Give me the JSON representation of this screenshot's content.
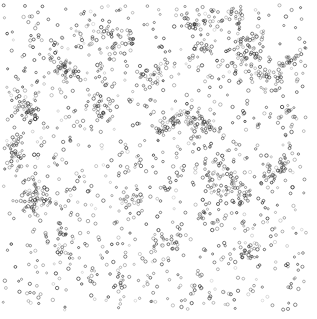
{
  "figure": {
    "width": 317,
    "height": 319,
    "background_color": "#ffffff",
    "has_axes": false,
    "has_border": false,
    "has_title": false,
    "has_legend": false,
    "has_gridlines": false,
    "has_tick_labels": false
  },
  "chart_data": {
    "type": "scatter",
    "title": "",
    "subtitle": "",
    "xlabel": "",
    "ylabel": "",
    "xlim": [
      0,
      317
    ],
    "ylim": [
      0,
      319
    ],
    "grid": false,
    "legend": null,
    "annotations": [],
    "tick_labels_x": [],
    "tick_labels_y": [],
    "marker": {
      "shape": "circle-open",
      "radius_px": 1.35,
      "line_width_px": 0.8,
      "fill": "none",
      "edge_color": "#3a3a3a",
      "edge_color_light": "#9a9a9a",
      "edge_color_dark": "#1a1a1a",
      "opacity_range": [
        0.35,
        0.95
      ]
    },
    "point_count_approx": 1760,
    "distribution": {
      "model": "clustered-plus-uniform-noise",
      "cluster_count": 46,
      "cluster_point_fraction": 0.55,
      "noise_point_fraction": 0.45,
      "cluster_sigma_px_range": [
        3.5,
        9.0
      ],
      "cluster_size_range": [
        9,
        34
      ],
      "plot_margin_px": {
        "top": 5,
        "right": 11,
        "bottom": 9,
        "left": 3
      }
    },
    "clusters": [
      {
        "x": 208,
        "y": 16,
        "n": 26,
        "s": 8.5
      },
      {
        "x": 236,
        "y": 14,
        "n": 18,
        "s": 6.0
      },
      {
        "x": 196,
        "y": 24,
        "n": 14,
        "s": 5.0
      },
      {
        "x": 78,
        "y": 37,
        "n": 22,
        "s": 9.0
      },
      {
        "x": 113,
        "y": 36,
        "n": 16,
        "s": 6.5
      },
      {
        "x": 126,
        "y": 40,
        "n": 12,
        "s": 5.0
      },
      {
        "x": 200,
        "y": 48,
        "n": 20,
        "s": 7.0
      },
      {
        "x": 246,
        "y": 47,
        "n": 15,
        "s": 6.0
      },
      {
        "x": 256,
        "y": 40,
        "n": 13,
        "s": 5.5
      },
      {
        "x": 241,
        "y": 62,
        "n": 24,
        "s": 7.5
      },
      {
        "x": 262,
        "y": 74,
        "n": 28,
        "s": 8.0
      },
      {
        "x": 274,
        "y": 70,
        "n": 16,
        "s": 6.0
      },
      {
        "x": 289,
        "y": 59,
        "n": 14,
        "s": 6.0
      },
      {
        "x": 57,
        "y": 64,
        "n": 18,
        "s": 7.0
      },
      {
        "x": 63,
        "y": 70,
        "n": 14,
        "s": 5.5
      },
      {
        "x": 74,
        "y": 71,
        "n": 12,
        "s": 5.0
      },
      {
        "x": 103,
        "y": 70,
        "n": 16,
        "s": 6.5
      },
      {
        "x": 152,
        "y": 72,
        "n": 14,
        "s": 6.0
      },
      {
        "x": 148,
        "y": 80,
        "n": 11,
        "s": 5.0
      },
      {
        "x": 22,
        "y": 101,
        "n": 24,
        "s": 8.0
      },
      {
        "x": 30,
        "y": 110,
        "n": 20,
        "s": 6.5
      },
      {
        "x": 98,
        "y": 104,
        "n": 18,
        "s": 6.5
      },
      {
        "x": 103,
        "y": 112,
        "n": 13,
        "s": 5.0
      },
      {
        "x": 176,
        "y": 120,
        "n": 22,
        "s": 7.5
      },
      {
        "x": 190,
        "y": 116,
        "n": 17,
        "s": 6.0
      },
      {
        "x": 197,
        "y": 132,
        "n": 20,
        "s": 7.0
      },
      {
        "x": 208,
        "y": 128,
        "n": 15,
        "s": 5.5
      },
      {
        "x": 163,
        "y": 128,
        "n": 12,
        "s": 5.0
      },
      {
        "x": 283,
        "y": 113,
        "n": 14,
        "s": 6.0
      },
      {
        "x": 13,
        "y": 147,
        "n": 16,
        "s": 6.5
      },
      {
        "x": 16,
        "y": 160,
        "n": 18,
        "s": 6.5
      },
      {
        "x": 35,
        "y": 190,
        "n": 22,
        "s": 7.5
      },
      {
        "x": 40,
        "y": 200,
        "n": 16,
        "s": 6.0
      },
      {
        "x": 30,
        "y": 207,
        "n": 13,
        "s": 5.0
      },
      {
        "x": 212,
        "y": 172,
        "n": 24,
        "s": 8.0
      },
      {
        "x": 228,
        "y": 186,
        "n": 26,
        "s": 8.5
      },
      {
        "x": 244,
        "y": 196,
        "n": 18,
        "s": 6.5
      },
      {
        "x": 270,
        "y": 175,
        "n": 20,
        "s": 7.0
      },
      {
        "x": 284,
        "y": 165,
        "n": 15,
        "s": 6.0
      },
      {
        "x": 207,
        "y": 210,
        "n": 16,
        "s": 6.0
      },
      {
        "x": 130,
        "y": 200,
        "n": 18,
        "s": 7.0
      },
      {
        "x": 66,
        "y": 240,
        "n": 20,
        "s": 7.5
      },
      {
        "x": 170,
        "y": 242,
        "n": 22,
        "s": 7.5
      },
      {
        "x": 250,
        "y": 254,
        "n": 16,
        "s": 6.5
      },
      {
        "x": 120,
        "y": 281,
        "n": 14,
        "s": 6.0
      },
      {
        "x": 196,
        "y": 288,
        "n": 12,
        "s": 5.5
      }
    ]
  }
}
